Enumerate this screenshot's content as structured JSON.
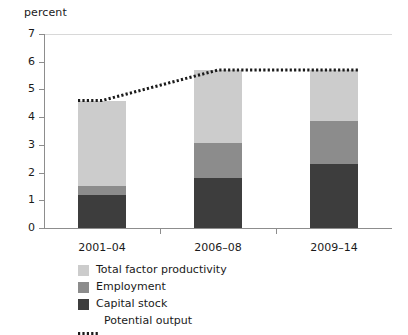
{
  "chart_data": {
    "type": "bar",
    "subtype": "stacked-bar-with-line-overlay",
    "title": "",
    "ylabel": "percent",
    "xlabel": "",
    "ylim": [
      0,
      7
    ],
    "yticks": [
      0,
      1,
      2,
      3,
      4,
      5,
      6,
      7
    ],
    "ytick_labels": [
      "0",
      "1",
      "2",
      "3",
      "4",
      "5",
      "6",
      "7"
    ],
    "grid": false,
    "legend_position": "bottom-center",
    "categories": [
      "2001–04",
      "2006–08",
      "2009–14"
    ],
    "series": [
      {
        "name": "Capital stock",
        "color": "#3d3d3d",
        "values": [
          1.2,
          1.8,
          2.3
        ]
      },
      {
        "name": "Employment",
        "color": "#8c8c8c",
        "values": [
          0.3,
          1.25,
          1.55
        ]
      },
      {
        "name": "Total factor productivity",
        "color": "#cccccc",
        "values": [
          3.1,
          2.65,
          1.85
        ]
      }
    ],
    "overlay": {
      "name": "Potential output",
      "type": "dotted-line",
      "color": "#1a1a1a",
      "values": [
        4.6,
        5.7,
        5.7
      ]
    },
    "stack_totals": [
      4.6,
      5.7,
      5.7
    ]
  },
  "axis": {
    "y_title": "percent"
  },
  "legend": {
    "items": [
      {
        "label": "Total factor productivity",
        "marker": "swatch",
        "color": "#cccccc"
      },
      {
        "label": "Employment",
        "marker": "swatch",
        "color": "#8c8c8c"
      },
      {
        "label": "Capital stock",
        "marker": "swatch",
        "color": "#3d3d3d"
      },
      {
        "label": "Potential output",
        "marker": "dotted-line",
        "color": "#1a1a1a"
      }
    ]
  }
}
